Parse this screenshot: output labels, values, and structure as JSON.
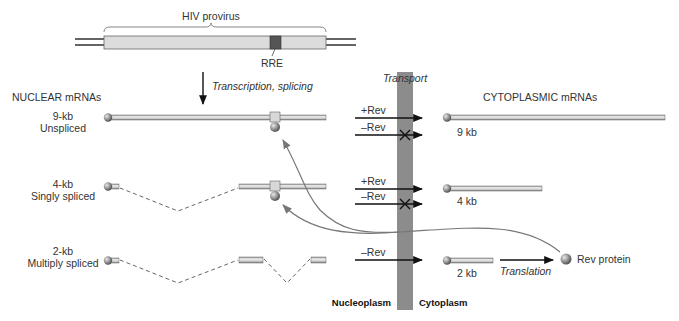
{
  "title": "HIV provirus",
  "rre_label": "RRE",
  "step_label": "Transcription, splicing",
  "transport_label": "Transport",
  "nuclear_header": "NUCLEAR mRNAs",
  "cytoplasmic_header": "CYTOPLASMIC mRNAs",
  "compartments": {
    "left": "Nucleoplasm",
    "right": "Cytoplasm"
  },
  "rows": [
    {
      "size": "9-kb",
      "type": "Unspliced",
      "arrows": [
        "+Rev",
        "–Rev"
      ],
      "blocked": [
        false,
        true
      ],
      "cyto_label": "9 kb"
    },
    {
      "size": "4-kb",
      "type": "Singly spliced",
      "arrows": [
        "+Rev",
        "–Rev"
      ],
      "blocked": [
        false,
        true
      ],
      "cyto_label": "4 kb"
    },
    {
      "size": "2-kb",
      "type": "Multiply spliced",
      "arrows": [
        "–Rev"
      ],
      "blocked": [
        false
      ],
      "cyto_label": "2 kb"
    }
  ],
  "translation_label": "Translation",
  "product_label": "Rev protein",
  "colors": {
    "provirus_fill": "#d9d9d9",
    "rre_fill": "#555555",
    "mrna_fill": "#d0d0d0",
    "transport_band": "#8c8c8c",
    "cap": "#7a7a7a",
    "curve": "#777777"
  }
}
